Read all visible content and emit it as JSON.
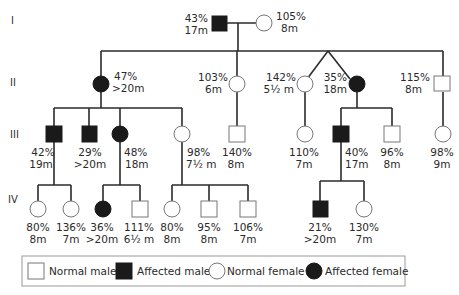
{
  "generations": [
    "I",
    "II",
    "III",
    "IV"
  ],
  "individuals": {
    "I_1": {
      "sex": "male",
      "affected": true,
      "pct": "43%",
      "age": "17m"
    },
    "I_2": {
      "sex": "female",
      "affected": false,
      "pct": "105%",
      "age": "8m"
    },
    "II_1": {
      "sex": "female",
      "affected": true,
      "pct": "47%",
      "age": ">20m"
    },
    "II_2": {
      "sex": "female",
      "affected": false,
      "pct": "103%",
      "age": "6m"
    },
    "II_3": {
      "sex": "female",
      "affected": false,
      "pct": "142%",
      "age": "5½ m"
    },
    "II_4": {
      "sex": "female",
      "affected": true,
      "pct": "35%",
      "age": "18m"
    },
    "II_5": {
      "sex": "male",
      "affected": false,
      "pct": "115%",
      "age": "8m"
    },
    "III_1": {
      "sex": "male",
      "affected": true,
      "pct": "42%",
      "age": "19m"
    },
    "III_2": {
      "sex": "male",
      "affected": true,
      "pct": "29%",
      "age": ">20m"
    },
    "III_3": {
      "sex": "female",
      "affected": true,
      "pct": "48%",
      "age": "18m"
    },
    "III_4": {
      "sex": "female",
      "affected": false,
      "pct": "98%",
      "age": "7½ m"
    },
    "III_5": {
      "sex": "male",
      "affected": false,
      "pct": "140%",
      "age": "8m"
    },
    "III_6": {
      "sex": "female",
      "affected": false,
      "pct": "110%",
      "age": "7m"
    },
    "III_7": {
      "sex": "male",
      "affected": true,
      "pct": "40%",
      "age": "17m"
    },
    "III_8": {
      "sex": "male",
      "affected": false,
      "pct": "96%",
      "age": "8m"
    },
    "III_9": {
      "sex": "female",
      "affected": false,
      "pct": "98%",
      "age": "9m"
    },
    "IV_1": {
      "sex": "female",
      "affected": false,
      "pct": "80%",
      "age": "8m"
    },
    "IV_2": {
      "sex": "female",
      "affected": false,
      "pct": "136%",
      "age": "7m"
    },
    "IV_3": {
      "sex": "female",
      "affected": true,
      "pct": "36%",
      "age": ">20m"
    },
    "IV_4": {
      "sex": "male",
      "affected": false,
      "pct": "111%",
      "age": "6½ m"
    },
    "IV_5": {
      "sex": "female",
      "affected": false,
      "pct": "80%",
      "age": "8m"
    },
    "IV_6": {
      "sex": "male",
      "affected": false,
      "pct": "95%",
      "age": "8m"
    },
    "IV_7": {
      "sex": "male",
      "affected": false,
      "pct": "106%",
      "age": "7m"
    },
    "IV_8": {
      "sex": "male",
      "affected": true,
      "pct": "21%",
      "age": ">20m"
    },
    "IV_9": {
      "sex": "female",
      "affected": false,
      "pct": "130%",
      "age": "7m"
    }
  },
  "legend": {
    "normal_male": "Normal male",
    "affected_male": "Affected male",
    "normal_female": "Normal female",
    "affected_female": "Affected female"
  },
  "colors": {
    "affected": "#1a1a1a",
    "normal_fill": "#ffffff",
    "line": "#2a2a2a"
  }
}
